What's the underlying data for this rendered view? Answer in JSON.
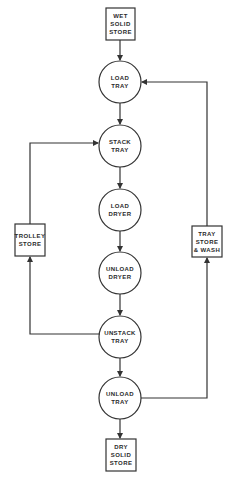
{
  "diagram": {
    "type": "process-flow",
    "colors": {
      "line": "#333333",
      "background": "#ffffff",
      "text": "#2a2a2a"
    },
    "nodes": [
      {
        "id": "wet_solid_store",
        "shape": "box",
        "lines": [
          "WET",
          "SOLID",
          "STORE"
        ]
      },
      {
        "id": "load_tray",
        "shape": "circle",
        "lines": [
          "LOAD",
          "TRAY"
        ]
      },
      {
        "id": "stack_tray",
        "shape": "circle",
        "lines": [
          "STACK",
          "TRAY"
        ]
      },
      {
        "id": "load_dryer",
        "shape": "circle",
        "lines": [
          "LOAD",
          "DRYER"
        ]
      },
      {
        "id": "unload_dryer",
        "shape": "circle",
        "lines": [
          "UNLOAD",
          "DRYER"
        ]
      },
      {
        "id": "unstack_tray",
        "shape": "circle",
        "lines": [
          "UNSTACK",
          "TRAY"
        ]
      },
      {
        "id": "unload_tray",
        "shape": "circle",
        "lines": [
          "UNLOAD",
          "TRAY"
        ]
      },
      {
        "id": "dry_solid_store",
        "shape": "box",
        "lines": [
          "DRY",
          "SOLID",
          "STORE"
        ]
      },
      {
        "id": "trolley_store",
        "shape": "box",
        "lines": [
          "TROLLEY",
          "STORE"
        ]
      },
      {
        "id": "tray_store_wash",
        "shape": "box",
        "lines": [
          "TRAY",
          "STORE",
          "& WASH"
        ]
      }
    ],
    "edges": [
      {
        "from": "wet_solid_store",
        "to": "load_tray"
      },
      {
        "from": "load_tray",
        "to": "stack_tray"
      },
      {
        "from": "stack_tray",
        "to": "load_dryer"
      },
      {
        "from": "load_dryer",
        "to": "unload_dryer"
      },
      {
        "from": "unload_dryer",
        "to": "unstack_tray"
      },
      {
        "from": "unstack_tray",
        "to": "unload_tray"
      },
      {
        "from": "unload_tray",
        "to": "dry_solid_store"
      },
      {
        "from": "unstack_tray",
        "to": "trolley_store"
      },
      {
        "from": "trolley_store",
        "to": "stack_tray"
      },
      {
        "from": "unload_tray",
        "to": "tray_store_wash"
      },
      {
        "from": "tray_store_wash",
        "to": "load_tray"
      }
    ]
  }
}
